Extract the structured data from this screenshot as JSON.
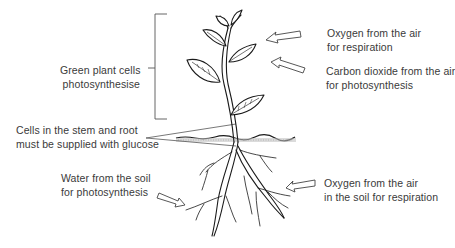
{
  "diagram": {
    "type": "labelled plant diagram",
    "colors": {
      "line": "#1a1a1a",
      "text": "#3a3a3a",
      "soil": "#8a8a8a",
      "background": "#ffffff"
    }
  },
  "labels": {
    "green_cells": {
      "line1": "Green plant cells",
      "line2": "photosynthesise"
    },
    "oxygen_air": {
      "line1": "Oxygen from the air",
      "line2": "for respiration"
    },
    "carbon_dioxide": {
      "line1": "Carbon dioxide from the air",
      "line2": "for photosynthesis"
    },
    "stem_root_cells": {
      "line1": "Cells in the stem and root",
      "line2": "must be supplied with glucose"
    },
    "water_soil": {
      "line1": "Water from the soil",
      "line2": "for photosynthesis"
    },
    "oxygen_soil": {
      "line1": "Oxygen from the air",
      "line2": "in the soil for respiration"
    }
  },
  "annotations": {
    "bracket": "spans shoot region (leaves and upper stem)",
    "arrows": [
      "oxygen into upper leaves",
      "carbon dioxide into leaf",
      "water into roots",
      "soil oxygen into roots"
    ],
    "pointer": "wedge from stem/root label to stem at soil line"
  }
}
